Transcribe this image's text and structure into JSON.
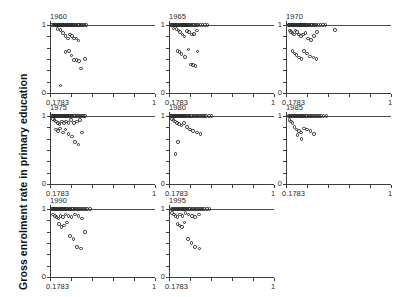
{
  "figure": {
    "ylabel": "Gross enrolment rate in primary education",
    "xlabel": "",
    "title": "",
    "panel_cols": 3,
    "panel_rows": 3,
    "marker": "open-circle",
    "marker_color": "#2b2b2b",
    "reference_line_y": 1,
    "background": "#ffffff"
  },
  "axes": {
    "x_tick_labels": [
      "0.1783",
      "1"
    ],
    "x_tick_values": [
      0.1783,
      1
    ],
    "x_minor_ticks": 5,
    "y_tick_labels": [
      "0",
      "1"
    ],
    "y_tick_values": [
      0,
      1
    ],
    "y_minor_ticks": 6,
    "xlim": [
      0.1783,
      1
    ],
    "ylim": [
      0,
      1.06
    ]
  },
  "chart_data": {
    "type": "scatter",
    "title": "",
    "xlabel": "",
    "ylabel": "Gross enrolment rate in primary education",
    "xlim": [
      0.1783,
      1
    ],
    "ylim": [
      0,
      1.06
    ],
    "grid": false,
    "legend": "none",
    "annotations": [
      "horizontal reference line at y = 1 in every panel"
    ],
    "panel_variable": "year",
    "panels": [
      {
        "label": "1960",
        "row": 1,
        "col": 1,
        "n": 52,
        "x": [
          0.196,
          0.205,
          0.212,
          0.219,
          0.226,
          0.232,
          0.238,
          0.244,
          0.251,
          0.258,
          0.264,
          0.271,
          0.278,
          0.285,
          0.292,
          0.299,
          0.306,
          0.313,
          0.321,
          0.329,
          0.336,
          0.344,
          0.352,
          0.36,
          0.368,
          0.377,
          0.386,
          0.396,
          0.406,
          0.417,
          0.43,
          0.444,
          0.458,
          0.236,
          0.259,
          0.281,
          0.3,
          0.318,
          0.335,
          0.352,
          0.368,
          0.385,
          0.402,
          0.3,
          0.329,
          0.345,
          0.366,
          0.385,
          0.404,
          0.42,
          0.452,
          0.262
        ],
        "y": [
          1.0,
          1.0,
          1.0,
          1.0,
          1.0,
          1.0,
          1.0,
          1.0,
          1.0,
          1.0,
          1.0,
          1.0,
          1.0,
          1.0,
          1.0,
          1.0,
          1.0,
          1.0,
          1.0,
          1.0,
          1.0,
          1.0,
          1.0,
          1.0,
          1.0,
          1.0,
          1.0,
          1.0,
          1.0,
          1.0,
          1.0,
          1.0,
          1.0,
          0.94,
          0.93,
          0.88,
          0.84,
          0.8,
          0.86,
          0.84,
          0.8,
          0.8,
          0.77,
          0.6,
          0.62,
          0.55,
          0.49,
          0.49,
          0.47,
          0.36,
          0.5,
          0.11
        ]
      },
      {
        "label": "1965",
        "row": 1,
        "col": 2,
        "n": 51,
        "x": [
          0.196,
          0.204,
          0.211,
          0.218,
          0.225,
          0.232,
          0.239,
          0.246,
          0.253,
          0.26,
          0.267,
          0.274,
          0.281,
          0.289,
          0.296,
          0.304,
          0.312,
          0.32,
          0.328,
          0.337,
          0.346,
          0.355,
          0.365,
          0.375,
          0.386,
          0.398,
          0.41,
          0.424,
          0.44,
          0.458,
          0.48,
          0.213,
          0.236,
          0.252,
          0.266,
          0.284,
          0.3,
          0.318,
          0.337,
          0.356,
          0.376,
          0.398,
          0.246,
          0.259,
          0.276,
          0.302,
          0.33,
          0.352,
          0.368,
          0.386,
          0.4
        ],
        "y": [
          1.0,
          1.0,
          1.0,
          1.0,
          1.0,
          1.0,
          1.0,
          1.0,
          1.0,
          1.0,
          1.0,
          1.0,
          1.0,
          1.0,
          1.0,
          1.0,
          1.0,
          1.0,
          1.0,
          1.0,
          1.0,
          1.0,
          1.0,
          1.0,
          1.0,
          1.0,
          1.0,
          1.0,
          1.0,
          1.0,
          1.0,
          0.95,
          0.94,
          0.92,
          0.9,
          0.86,
          0.83,
          0.91,
          0.9,
          0.86,
          0.87,
          0.92,
          0.62,
          0.6,
          0.57,
          0.53,
          0.64,
          0.42,
          0.41,
          0.4,
          0.61
        ]
      },
      {
        "label": "1970",
        "row": 1,
        "col": 3,
        "n": 57,
        "x": [
          0.197,
          0.204,
          0.211,
          0.218,
          0.225,
          0.232,
          0.239,
          0.246,
          0.253,
          0.26,
          0.267,
          0.274,
          0.281,
          0.288,
          0.295,
          0.303,
          0.311,
          0.319,
          0.327,
          0.335,
          0.344,
          0.353,
          0.362,
          0.372,
          0.382,
          0.393,
          0.405,
          0.418,
          0.432,
          0.448,
          0.466,
          0.488,
          0.208,
          0.218,
          0.228,
          0.24,
          0.252,
          0.265,
          0.28,
          0.296,
          0.312,
          0.33,
          0.35,
          0.372,
          0.396,
          0.42,
          0.228,
          0.244,
          0.26,
          0.282,
          0.3,
          0.32,
          0.344,
          0.368,
          0.392,
          0.416,
          0.56
        ],
        "y": [
          1.0,
          1.0,
          1.0,
          1.0,
          1.0,
          1.0,
          1.0,
          1.0,
          1.0,
          1.0,
          1.0,
          1.0,
          1.0,
          1.0,
          1.0,
          1.0,
          1.0,
          1.0,
          1.0,
          1.0,
          1.0,
          1.0,
          1.0,
          1.0,
          1.0,
          1.0,
          1.0,
          1.0,
          1.0,
          1.0,
          1.0,
          1.0,
          0.92,
          0.9,
          0.88,
          0.86,
          0.92,
          0.9,
          0.86,
          0.84,
          0.86,
          0.88,
          0.8,
          0.78,
          0.84,
          0.9,
          0.62,
          0.58,
          0.56,
          0.52,
          0.5,
          0.62,
          0.58,
          0.54,
          0.52,
          0.5,
          0.93
        ]
      },
      {
        "label": "1975",
        "row": 2,
        "col": 1,
        "n": 53,
        "x": [
          0.195,
          0.202,
          0.209,
          0.216,
          0.223,
          0.23,
          0.237,
          0.244,
          0.251,
          0.258,
          0.265,
          0.272,
          0.279,
          0.287,
          0.295,
          0.303,
          0.311,
          0.319,
          0.327,
          0.336,
          0.345,
          0.354,
          0.364,
          0.374,
          0.385,
          0.396,
          0.408,
          0.421,
          0.435,
          0.45,
          0.2,
          0.212,
          0.226,
          0.24,
          0.254,
          0.27,
          0.286,
          0.304,
          0.322,
          0.342,
          0.364,
          0.388,
          0.414,
          0.226,
          0.24,
          0.258,
          0.278,
          0.3,
          0.324,
          0.35,
          0.376,
          0.402,
          0.428
        ],
        "y": [
          1.0,
          1.0,
          1.0,
          1.0,
          1.0,
          1.0,
          1.0,
          1.0,
          1.0,
          1.0,
          1.0,
          1.0,
          1.0,
          1.0,
          1.0,
          1.0,
          1.0,
          1.0,
          1.0,
          1.0,
          1.0,
          1.0,
          1.0,
          1.0,
          1.0,
          1.0,
          1.0,
          1.0,
          1.0,
          1.0,
          0.96,
          0.94,
          0.92,
          0.9,
          0.88,
          0.92,
          0.9,
          0.92,
          0.9,
          0.94,
          0.9,
          0.92,
          0.94,
          0.8,
          0.78,
          0.82,
          0.76,
          0.8,
          0.74,
          0.7,
          0.62,
          0.58,
          0.76
        ]
      },
      {
        "label": "1980",
        "row": 2,
        "col": 2,
        "n": 46,
        "x": [
          0.196,
          0.203,
          0.21,
          0.217,
          0.224,
          0.231,
          0.238,
          0.245,
          0.252,
          0.259,
          0.266,
          0.273,
          0.281,
          0.289,
          0.297,
          0.305,
          0.313,
          0.322,
          0.331,
          0.34,
          0.35,
          0.36,
          0.371,
          0.382,
          0.394,
          0.407,
          0.421,
          0.436,
          0.452,
          0.47,
          0.49,
          0.512,
          0.2,
          0.212,
          0.226,
          0.242,
          0.258,
          0.276,
          0.296,
          0.318,
          0.342,
          0.368,
          0.396,
          0.424,
          0.25,
          0.23
        ],
        "y": [
          1.0,
          1.0,
          1.0,
          1.0,
          1.0,
          1.0,
          1.0,
          1.0,
          1.0,
          1.0,
          1.0,
          1.0,
          1.0,
          1.0,
          1.0,
          1.0,
          1.0,
          1.0,
          1.0,
          1.0,
          1.0,
          1.0,
          1.0,
          1.0,
          1.0,
          1.0,
          1.0,
          1.0,
          1.0,
          1.0,
          1.0,
          1.0,
          0.96,
          0.94,
          0.92,
          0.9,
          0.88,
          0.86,
          0.9,
          0.84,
          0.8,
          0.78,
          0.76,
          0.74,
          0.62,
          0.44
        ]
      },
      {
        "label": "1985",
        "row": 2,
        "col": 3,
        "n": 41,
        "x": [
          0.197,
          0.205,
          0.213,
          0.221,
          0.229,
          0.237,
          0.245,
          0.253,
          0.261,
          0.269,
          0.277,
          0.286,
          0.295,
          0.304,
          0.313,
          0.323,
          0.333,
          0.343,
          0.354,
          0.365,
          0.377,
          0.39,
          0.404,
          0.419,
          0.435,
          0.453,
          0.473,
          0.496,
          0.205,
          0.216,
          0.229,
          0.244,
          0.26,
          0.278,
          0.298,
          0.32,
          0.344,
          0.37,
          0.398,
          0.3,
          0.268
        ],
        "y": [
          1.0,
          1.0,
          1.0,
          1.0,
          1.0,
          1.0,
          1.0,
          1.0,
          1.0,
          1.0,
          1.0,
          1.0,
          1.0,
          1.0,
          1.0,
          1.0,
          1.0,
          1.0,
          1.0,
          1.0,
          1.0,
          1.0,
          1.0,
          1.0,
          1.0,
          1.0,
          1.0,
          1.0,
          0.94,
          0.92,
          0.9,
          0.84,
          0.8,
          0.78,
          0.76,
          0.82,
          0.8,
          0.78,
          0.74,
          0.66,
          0.72
        ]
      },
      {
        "label": "1990",
        "row": 3,
        "col": 1,
        "n": 52,
        "x": [
          0.196,
          0.203,
          0.21,
          0.217,
          0.224,
          0.231,
          0.238,
          0.245,
          0.252,
          0.259,
          0.266,
          0.273,
          0.281,
          0.289,
          0.297,
          0.305,
          0.313,
          0.322,
          0.331,
          0.34,
          0.35,
          0.36,
          0.371,
          0.382,
          0.394,
          0.407,
          0.421,
          0.436,
          0.452,
          0.47,
          0.49,
          0.204,
          0.216,
          0.23,
          0.245,
          0.262,
          0.28,
          0.3,
          0.322,
          0.346,
          0.372,
          0.4,
          0.43,
          0.25,
          0.268,
          0.288,
          0.31,
          0.336,
          0.362,
          0.39,
          0.42,
          0.45
        ],
        "y": [
          1.0,
          1.0,
          1.0,
          1.0,
          1.0,
          1.0,
          1.0,
          1.0,
          1.0,
          1.0,
          1.0,
          1.0,
          1.0,
          1.0,
          1.0,
          1.0,
          1.0,
          1.0,
          1.0,
          1.0,
          1.0,
          1.0,
          1.0,
          1.0,
          1.0,
          1.0,
          1.0,
          1.0,
          1.0,
          1.0,
          1.0,
          0.92,
          0.9,
          0.88,
          0.86,
          0.9,
          0.88,
          0.92,
          0.9,
          0.88,
          0.92,
          0.9,
          0.86,
          0.78,
          0.74,
          0.76,
          0.8,
          0.6,
          0.56,
          0.44,
          0.42,
          0.66
        ]
      },
      {
        "label": "1995",
        "row": 3,
        "col": 2,
        "n": 47,
        "x": [
          0.198,
          0.206,
          0.214,
          0.222,
          0.23,
          0.238,
          0.246,
          0.254,
          0.262,
          0.27,
          0.278,
          0.287,
          0.296,
          0.305,
          0.314,
          0.324,
          0.334,
          0.344,
          0.355,
          0.366,
          0.378,
          0.391,
          0.405,
          0.42,
          0.436,
          0.454,
          0.474,
          0.496,
          0.204,
          0.216,
          0.23,
          0.246,
          0.264,
          0.284,
          0.306,
          0.33,
          0.356,
          0.384,
          0.414,
          0.246,
          0.262,
          0.28,
          0.3,
          0.326,
          0.354,
          0.384,
          0.416
        ],
        "y": [
          1.0,
          1.0,
          1.0,
          1.0,
          1.0,
          1.0,
          1.0,
          1.0,
          1.0,
          1.0,
          1.0,
          1.0,
          1.0,
          1.0,
          1.0,
          1.0,
          1.0,
          1.0,
          1.0,
          1.0,
          1.0,
          1.0,
          1.0,
          1.0,
          1.0,
          1.0,
          1.0,
          1.0,
          0.94,
          0.92,
          0.9,
          0.88,
          0.92,
          0.9,
          0.94,
          0.92,
          0.9,
          0.88,
          0.92,
          0.78,
          0.76,
          0.74,
          0.8,
          0.56,
          0.5,
          0.44,
          0.42
        ]
      }
    ]
  }
}
